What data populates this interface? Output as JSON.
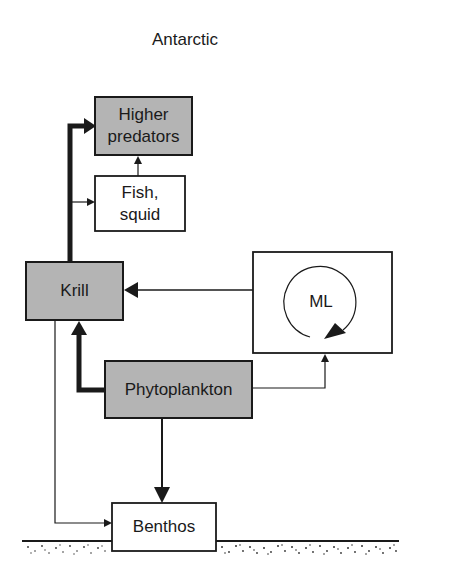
{
  "title": "Antarctic",
  "colors": {
    "box_gray": "#b4b4b4",
    "box_white": "#ffffff",
    "line": "#1a1a1a"
  },
  "nodes": [
    {
      "id": "higher_predators",
      "label": "Higher predators",
      "lines": [
        "Higher",
        "predators"
      ],
      "fill": "gray"
    },
    {
      "id": "fish_squid",
      "label": "Fish, squid",
      "lines": [
        "Fish,",
        "squid"
      ],
      "fill": "white"
    },
    {
      "id": "krill",
      "label": "Krill",
      "lines": [
        "Krill"
      ],
      "fill": "gray"
    },
    {
      "id": "ml",
      "label": "ML",
      "lines": [
        "ML"
      ],
      "fill": "white",
      "decoration": "circular-arrow"
    },
    {
      "id": "phytoplankton",
      "label": "Phytoplankton",
      "lines": [
        "Phytoplankton"
      ],
      "fill": "gray"
    },
    {
      "id": "benthos",
      "label": "Benthos",
      "lines": [
        "Benthos"
      ],
      "fill": "white"
    }
  ],
  "edges": [
    {
      "from": "krill",
      "to": "higher_predators",
      "weight": "thick"
    },
    {
      "from": "krill",
      "to": "fish_squid",
      "weight": "thin"
    },
    {
      "from": "fish_squid",
      "to": "higher_predators",
      "weight": "thin"
    },
    {
      "from": "ml",
      "to": "krill",
      "weight": "thin"
    },
    {
      "from": "phytoplankton",
      "to": "krill",
      "weight": "thick"
    },
    {
      "from": "phytoplankton",
      "to": "ml",
      "weight": "thin"
    },
    {
      "from": "phytoplankton",
      "to": "benthos",
      "weight": "medium"
    },
    {
      "from": "krill",
      "to": "benthos",
      "weight": "thin"
    }
  ],
  "seafloor": "sediment"
}
